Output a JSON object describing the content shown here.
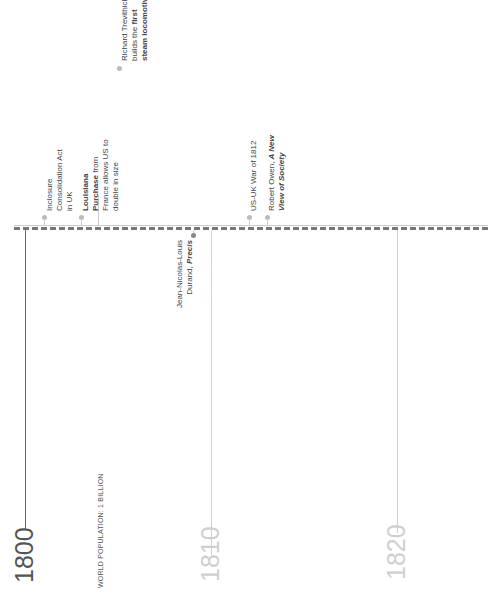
{
  "timeline": {
    "years": [
      {
        "label": "1800",
        "color": "#555555"
      },
      {
        "label": "1810",
        "color": "#cfcfcf"
      },
      {
        "label": "1820",
        "color": "#cfcfcf"
      }
    ],
    "population_note": "WORLD POPULATION: 1 BILLION",
    "events": [
      {
        "lines": [
          "Inclosure",
          "Consolidation Act",
          "in UK"
        ]
      },
      {
        "bold1": "Louisiana",
        "bold2": "Purchase",
        "rest2": " from",
        "line3": "France allows US to",
        "line4": "double in size"
      },
      {
        "line1": "Richard Trevithick",
        "line2": "builds the ",
        "bold2": "first",
        "bold3": "steam locomotive"
      },
      {
        "line1": "Jean-Nicolas-Louis",
        "line2": "Durand, ",
        "bi2": "Precis"
      },
      {
        "line1": "US-UK War of 1812"
      },
      {
        "line1": "Robert Owen, ",
        "bi1": "A New",
        "bi2": "View of Society"
      }
    ]
  }
}
